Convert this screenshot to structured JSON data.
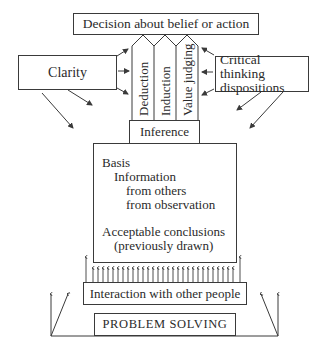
{
  "diagram": {
    "decision": "Decision about belief or action",
    "pillars": [
      {
        "label": "Deduction"
      },
      {
        "label": "Induction"
      },
      {
        "label": "Value judging"
      }
    ],
    "clarity": "Clarity",
    "dispositions": {
      "line1": "Critical thinking",
      "line2": "dispositions"
    },
    "inference": "Inference",
    "basis": {
      "title": "Basis",
      "information": "Information",
      "from_others": "from others",
      "from_observation": "from observation",
      "acceptable": "Acceptable conclusions",
      "previously": "(previously drawn)"
    },
    "interaction": "Interaction with other people",
    "problem_solving": "PROBLEM SOLVING"
  },
  "colors": {
    "ink": "#3a3a3a",
    "background": "#ffffff"
  }
}
